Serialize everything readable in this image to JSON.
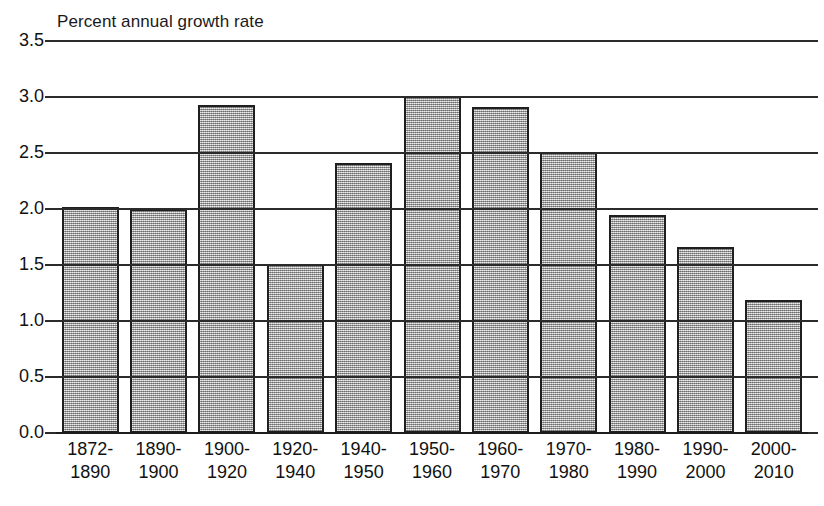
{
  "chart_data": {
    "type": "bar",
    "title": "Percent annual growth rate",
    "xlabel": "",
    "ylabel": "",
    "ylim": [
      0.0,
      3.5
    ],
    "yticks": [
      "3.5",
      "3.0",
      "2.5",
      "2.0",
      "1.5",
      "1.0",
      "0.5",
      "0.0"
    ],
    "ytick_values": [
      3.5,
      3.0,
      2.5,
      2.0,
      1.5,
      1.0,
      0.5,
      0.0
    ],
    "grid": true,
    "legend": "none",
    "categories": [
      "1872-1890",
      "1890-1900",
      "1900-1920",
      "1920-1940",
      "1940-1950",
      "1950-1960",
      "1960-1970",
      "1970-1980",
      "1980-1990",
      "1990-2000",
      "2000-2010"
    ],
    "category_lines": [
      [
        "1872-",
        "1890"
      ],
      [
        "1890-",
        "1900"
      ],
      [
        "1900-",
        "1920"
      ],
      [
        "1920-",
        "1940"
      ],
      [
        "1940-",
        "1950"
      ],
      [
        "1950-",
        "1960"
      ],
      [
        "1960-",
        "1970"
      ],
      [
        "1970-",
        "1980"
      ],
      [
        "1980-",
        "1990"
      ],
      [
        "1990-",
        "2000"
      ],
      [
        "2000-",
        "2010"
      ]
    ],
    "values": [
      2.01,
      1.99,
      2.92,
      1.5,
      2.4,
      3.0,
      2.9,
      2.5,
      1.94,
      1.65,
      1.18
    ],
    "bar_fill_color": "#b3b3b3",
    "bar_edge_color": "#1f1f1f",
    "gridline_color": "#2b2b2b",
    "background_color": "#ffffff",
    "text_color": "#111111"
  }
}
